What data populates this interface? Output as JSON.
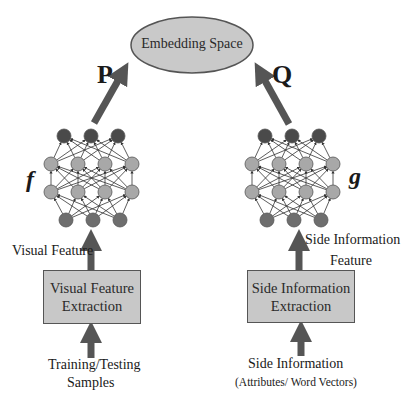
{
  "diagram": {
    "embedding": {
      "label": "Embedding Space",
      "fill": "#c9c9c9",
      "stroke": "#555555"
    },
    "projections": {
      "left": "P",
      "right": "Q"
    },
    "networks": {
      "left": {
        "label": "f"
      },
      "right": {
        "label": "g"
      }
    },
    "feature_labels": {
      "left": "Visual Feature",
      "right_line1": "Side Information",
      "right_line2": "Feature"
    },
    "boxes": {
      "left": {
        "line1": "Visual Feature",
        "line2": "Extraction"
      },
      "right": {
        "line1": "Side Information",
        "line2": "Extraction"
      }
    },
    "inputs": {
      "left_line1": "Training/Testing",
      "left_line2": "Samples",
      "right_line1": "Side Information",
      "right_line2": "(Attributes/ Word Vectors)"
    },
    "colors": {
      "arrow": "#555555",
      "node_dark": "#4a4a4a",
      "node_light": "#a8a8a8",
      "node_bottom": "#6e6e6e",
      "edge": "#333333",
      "box_fill": "#c8c8c8"
    }
  }
}
